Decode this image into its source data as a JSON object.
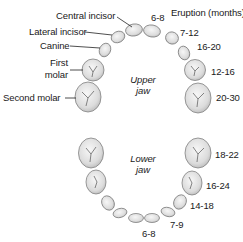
{
  "header": {
    "eruption_title": "Eruption (months)"
  },
  "upper_jaw": {
    "title_line1": "Upper",
    "title_line2": "jaw",
    "labels": {
      "central_incisor": "Central incisor",
      "lateral_incisor": "Lateral incisor",
      "canine": "Canine",
      "first_molar_line1": "First",
      "first_molar_line2": "molar",
      "second_molar": "Second molar"
    },
    "eruption": {
      "central_incisor": "6-8",
      "lateral_incisor": "7-12",
      "canine": "16-20",
      "first_molar": "12-16",
      "second_molar": "20-30"
    }
  },
  "lower_jaw": {
    "title_line1": "Lower",
    "title_line2": "jaw",
    "eruption": {
      "second_molar": "18-22",
      "first_molar": "16-24",
      "canine": "14-18",
      "lateral_incisor": "7-9",
      "central_incisor": "6-8"
    }
  },
  "colors": {
    "tooth_fill": "#e6e6e6",
    "tooth_stroke": "#7a7a7a",
    "text": "#1a1a1a"
  }
}
